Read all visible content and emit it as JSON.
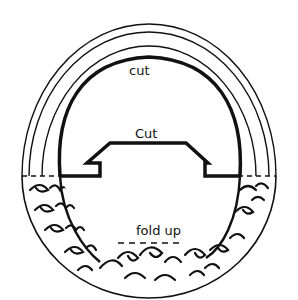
{
  "diagram": {
    "type": "craft-template",
    "background": "#ffffff",
    "ink": "#111111",
    "labels": {
      "outer_cut": "cut",
      "inner_cut": "Cut",
      "fold": "fold up"
    },
    "regions": [
      "outer-rings",
      "arch-cut-line",
      "tab-cut-line",
      "fold-line",
      "wave-pattern-band"
    ]
  }
}
